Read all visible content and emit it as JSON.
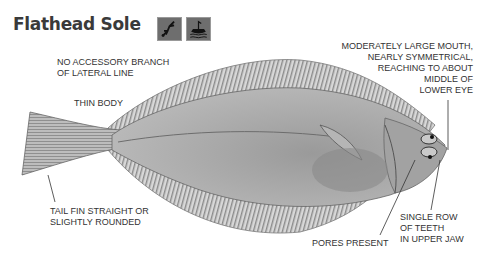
{
  "header": {
    "title": "Flathead Sole",
    "icons": [
      {
        "name": "diver-icon",
        "label": "diving"
      },
      {
        "name": "boat-icon",
        "label": "boat fishing"
      }
    ]
  },
  "annotations": {
    "lateral_line": [
      "NO ACCESSORY BRANCH",
      "OF LATERAL LINE"
    ],
    "body": "THIN BODY",
    "tail": [
      "TAIL FIN STRAIGHT OR",
      "SLIGHTLY ROUNDED"
    ],
    "mouth": [
      "MODERATELY LARGE MOUTH,",
      "NEARLY SYMMETRICAL,",
      "REACHING TO ABOUT",
      "MIDDLE OF",
      "LOWER EYE"
    ],
    "pores": "PORES PRESENT",
    "teeth": [
      "SINGLE ROW",
      "OF TEETH",
      "IN UPPER JAW"
    ]
  },
  "colors": {
    "body": "#a9a9a9",
    "fin": "#c8c8c8",
    "text": "#333333"
  }
}
